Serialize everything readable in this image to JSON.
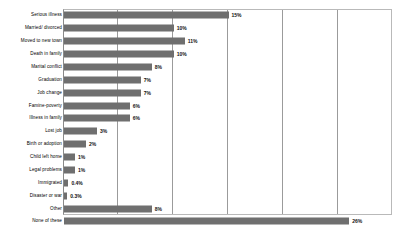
{
  "chart_data": {
    "type": "bar",
    "orientation": "horizontal",
    "title": "",
    "subtitle": "",
    "xlabel": "",
    "ylabel": "",
    "xlim": [
      0,
      30
    ],
    "xticks": [
      0,
      5,
      10,
      15,
      20,
      25,
      30
    ],
    "grid": true,
    "legend": null,
    "bar_color": "#6f6f6f",
    "frame_color": "#b9b9b9",
    "gridline_color": "#9b9b9b",
    "categories": [
      "Serious illness",
      "Married/ divorced",
      "Moved to new town",
      "Death in family",
      "Marital conflict",
      "Graduation",
      "Job change",
      "Famine-poverty",
      "Illness in family",
      "Lost job",
      "Birth or adoption",
      "Child left home",
      "Legal problems",
      "Immigrated",
      "Disaster or war",
      "Other",
      "None of these"
    ],
    "values": [
      15,
      10,
      11,
      10,
      8,
      7,
      7,
      6,
      6,
      3,
      2,
      1,
      1,
      0.4,
      0.3,
      8,
      26
    ],
    "value_labels": [
      "15%",
      "10%",
      "11%",
      "10%",
      "8%",
      "7%",
      "7%",
      "6%",
      "6%",
      "3%",
      "2%",
      "1%",
      "1%",
      "0.4%",
      "0.3%",
      "8%",
      "26%"
    ]
  }
}
